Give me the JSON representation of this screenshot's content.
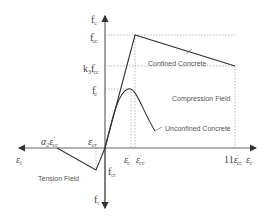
{
  "diagram": {
    "type": "stress-strain diagram",
    "axes": {
      "y_top_label": "f",
      "y_top_sub": "c",
      "y_bottom_label": "f",
      "y_bottom_sub": "t",
      "x_right_label": "ε",
      "x_right_sub": "c",
      "x_left_label": "ε",
      "x_left_sub": "t"
    },
    "y_ticks": {
      "fcc": {
        "main": "f",
        "prime": "'",
        "sub": "cc"
      },
      "k3fcc": {
        "pre": "k",
        "pre_sub": "3",
        "main": "f",
        "prime": "'",
        "sub": "cc"
      },
      "fc": {
        "main": "f",
        "prime": "'",
        "sub": "c"
      },
      "fct": {
        "main": "f",
        "sub": "ct"
      }
    },
    "x_ticks": {
      "ecr": {
        "main": "ε",
        "sub": "cr"
      },
      "ec": {
        "main": "ε",
        "prime": "'",
        "sub": "c"
      },
      "ecc": {
        "main": "ε",
        "prime": "'",
        "sub": "cc"
      },
      "e11": {
        "pre": "11",
        "main": "ε",
        "prime": "'",
        "sub": "cc"
      },
      "alpha": {
        "pre": "α",
        "pre_sub": "2",
        "main": "ε",
        "prime": "'",
        "sub": "cc"
      }
    },
    "labels": {
      "confined": "Confined Concrete",
      "compression": "Compression Field",
      "unconfined": "Unconfined Concrete",
      "tension": "Tension Field"
    },
    "colors": {
      "axis": "#666666",
      "curve": "#333333",
      "guide": "#999999"
    }
  }
}
